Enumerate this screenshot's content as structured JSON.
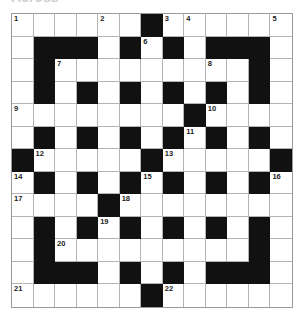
{
  "puzzle": {
    "heading": "Across",
    "rows": 13,
    "cols": 13,
    "colors": {
      "black": "#111111",
      "white": "#ffffff",
      "gridline": "#b4b4b4"
    },
    "layout": [
      "W W W W W W B W W W W W W",
      "W B B B W B W B W B B B W",
      "W B W W W W W W W W W B W",
      "W B W B W B W B W B W B W",
      "W W W W W W W W B W W W W",
      "W B W B W B W B W B W B W",
      "B W W W W W B W W W W W B",
      "W B W B W B W B W B W B W",
      "W W W W B W W W W W W W W",
      "W B W B W B W B W B W B W",
      "W B W W W W W W W W W B W",
      "W B B B W B W B W B B B W",
      "W W W W W W B W W W W W W"
    ],
    "numbers": [
      {
        "row": 0,
        "col": 0,
        "n": "1"
      },
      {
        "row": 0,
        "col": 4,
        "n": "2"
      },
      {
        "row": 0,
        "col": 7,
        "n": "3"
      },
      {
        "row": 0,
        "col": 8,
        "n": "4"
      },
      {
        "row": 0,
        "col": 12,
        "n": "5"
      },
      {
        "row": 1,
        "col": 6,
        "n": "6"
      },
      {
        "row": 2,
        "col": 2,
        "n": "7"
      },
      {
        "row": 2,
        "col": 9,
        "n": "8"
      },
      {
        "row": 4,
        "col": 0,
        "n": "9"
      },
      {
        "row": 4,
        "col": 9,
        "n": "10"
      },
      {
        "row": 5,
        "col": 8,
        "n": "11"
      },
      {
        "row": 6,
        "col": 1,
        "n": "12"
      },
      {
        "row": 6,
        "col": 7,
        "n": "13"
      },
      {
        "row": 7,
        "col": 0,
        "n": "14"
      },
      {
        "row": 7,
        "col": 6,
        "n": "15"
      },
      {
        "row": 7,
        "col": 12,
        "n": "16"
      },
      {
        "row": 8,
        "col": 0,
        "n": "17"
      },
      {
        "row": 8,
        "col": 5,
        "n": "18"
      },
      {
        "row": 9,
        "col": 4,
        "n": "19"
      },
      {
        "row": 10,
        "col": 2,
        "n": "20"
      },
      {
        "row": 12,
        "col": 0,
        "n": "21"
      },
      {
        "row": 12,
        "col": 7,
        "n": "22"
      }
    ]
  }
}
